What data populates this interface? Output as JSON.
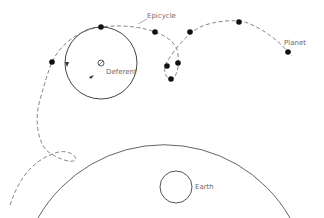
{
  "diagram": {
    "labels": {
      "epicycle": "Epicycle",
      "deferent": "Deferent",
      "planet": "Planet",
      "earth": "Earth"
    },
    "colors": {
      "line": "#555555",
      "dash": "#777777",
      "dot": "#111111",
      "text": "#6a6a6a"
    },
    "elements": {
      "earth": {
        "cx": 176,
        "cy": 187,
        "r": 16
      },
      "deferent": {
        "cx": 176,
        "cy": 187,
        "r": 145
      },
      "epicycle": {
        "cx": 101,
        "cy": 63,
        "r": 36
      },
      "planet_positions": [
        [
          52,
          62
        ],
        [
          101,
          27
        ],
        [
          155,
          32
        ],
        [
          239,
          22
        ],
        [
          288,
          52
        ],
        [
          173,
          53
        ],
        [
          167,
          66
        ],
        [
          178,
          63
        ],
        [
          171,
          79
        ]
      ]
    }
  }
}
